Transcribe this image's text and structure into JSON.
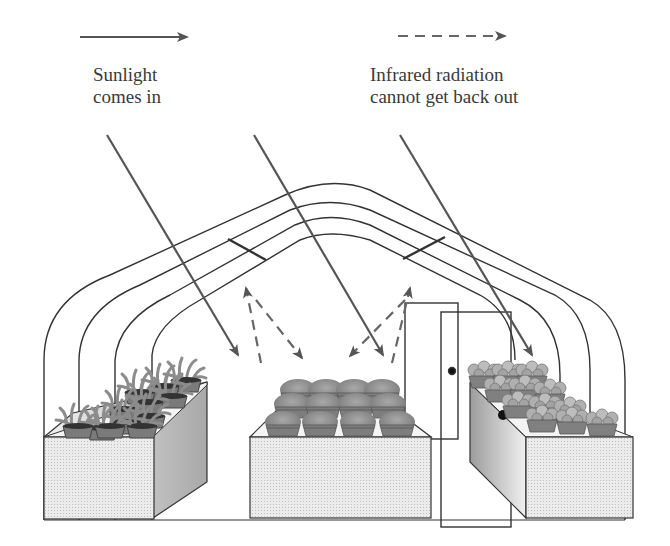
{
  "legend": {
    "sunlight": {
      "line1": "Sunlight",
      "line2": "comes in",
      "style": "solid-arrow"
    },
    "infrared": {
      "line1": "Infrared radiation",
      "line2": "cannot get back out",
      "style": "dashed-arrow"
    }
  },
  "colors": {
    "arrow": "#555555",
    "outline": "#333333",
    "bench_fill": "#e4e4e4",
    "bench_side": "#cfcfcf",
    "plant": "#8a8a8a",
    "pot": "#6e6e6e",
    "background": "#ffffff"
  },
  "scene": {
    "structure": "hoop greenhouse with four arched frames",
    "sunlight_rays": 3,
    "infrared_reflections": 4,
    "benches": [
      {
        "position": "left",
        "contents": "spiky leafy plants in pots",
        "count": 12
      },
      {
        "position": "center",
        "contents": "round shrubs in pots",
        "count": 12
      },
      {
        "position": "right",
        "contents": "flowering plants in pots",
        "count": 12
      }
    ],
    "door": {
      "position": "back right",
      "has_handle": true
    }
  }
}
